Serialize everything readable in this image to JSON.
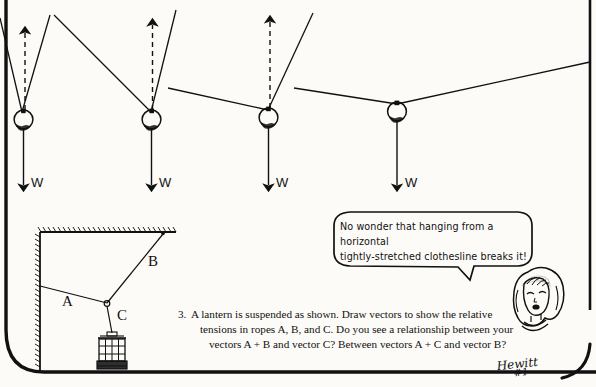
{
  "page": {
    "background_color": "#fcfbf8",
    "ink_color": "#111111",
    "width": 596,
    "height": 387
  },
  "top_diagram": {
    "description": "Four identical balls hung on a rope at progressively shallower rope angles, each with weight vector W pointing down and a dashed upward resultant of rope tensions.",
    "weight_label": "W",
    "balls": [
      {
        "id": "ball-1",
        "weight_label": "W",
        "cx": 22,
        "cy": 119,
        "rope_angle_note": "steep narrow V"
      },
      {
        "id": "ball-2",
        "weight_label": "W",
        "cx": 151,
        "cy": 119,
        "rope_angle_note": "wider V"
      },
      {
        "id": "ball-3",
        "weight_label": "W",
        "cx": 268,
        "cy": 117,
        "rope_angle_note": "much wider V"
      },
      {
        "id": "ball-4",
        "weight_label": "W",
        "cx": 397,
        "cy": 110,
        "rope_angle_note": "nearly horizontal"
      }
    ]
  },
  "lantern_diagram": {
    "description": "A lantern hung by rope C from a junction, held by rope A to the wall and rope B to the ceiling.",
    "labels": {
      "rope_a": "A",
      "rope_b": "B",
      "rope_c": "C"
    }
  },
  "speech_bubble": {
    "speaker": "cartoon-girl",
    "lines": [
      "No wonder that hanging from a horizontal",
      "tightly-stretched clothesline breaks it!"
    ]
  },
  "question": {
    "number": "3.",
    "lines": [
      "A lantern is suspended as shown.  Draw vectors to show the relative",
      "tensions in ropes A, B, and C.  Do you see a relationship between your",
      "vectors A + B and vector C?   Between vectors A + C and vector B?"
    ]
  },
  "signature": {
    "name": "Hewitt",
    "mark": "#1"
  }
}
